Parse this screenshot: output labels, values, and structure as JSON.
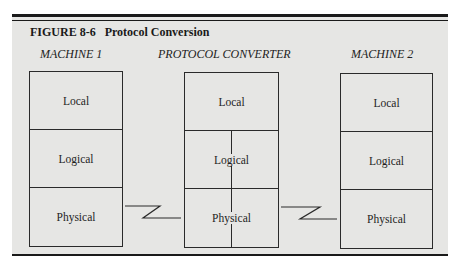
{
  "figure": {
    "title": "FIGURE 8-6   Protocol Conversion",
    "columns": [
      {
        "label": "MACHINE 1",
        "layers": [
          "Local",
          "Logical",
          "Physical"
        ]
      },
      {
        "label": "PROTOCOL CONVERTER",
        "layers": [
          "Local",
          "Logical",
          "Physical"
        ]
      },
      {
        "label": "MACHINE 2",
        "layers": [
          "Local",
          "Logical",
          "Physical"
        ]
      }
    ],
    "links": [
      {
        "from": "MACHINE 1 Physical",
        "to": "PROTOCOL CONVERTER Physical"
      },
      {
        "from": "PROTOCOL CONVERTER Physical",
        "to": "MACHINE 2 Physical"
      }
    ]
  }
}
